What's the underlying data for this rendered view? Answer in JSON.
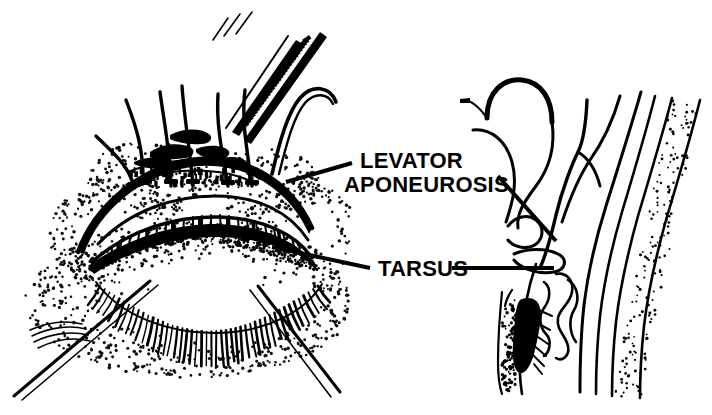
{
  "figure": {
    "background_color": "#ffffff",
    "ink_color": "#000000",
    "style": "pen-and-ink stipple line drawing",
    "width": 712,
    "height": 415
  },
  "labels": [
    {
      "id": "levator-aponeurosis",
      "line1": "LEVATOR",
      "line2": "APONEUROSIS",
      "x": 360,
      "y": 168,
      "font_size": 22
    },
    {
      "id": "tarsus",
      "line1": "TARSUS",
      "x": 378,
      "y": 274,
      "font_size": 22
    }
  ],
  "leader_lines": [
    {
      "id": "levator-leader-left",
      "from": [
        352,
        163
      ],
      "to": [
        286,
        182
      ],
      "width": 4
    },
    {
      "id": "levator-leader-right",
      "from": [
        498,
        175
      ],
      "to": [
        556,
        240
      ],
      "width": 4
    },
    {
      "id": "tarsus-leader-left",
      "from": [
        370,
        268
      ],
      "to": [
        272,
        247
      ],
      "width": 4
    },
    {
      "id": "tarsus-leader-right",
      "from": [
        452,
        268
      ],
      "to": [
        552,
        268
      ],
      "width": 4
    }
  ],
  "panels": [
    {
      "id": "frontal-view",
      "name": "frontal eyelid exposure",
      "region": [
        10,
        15,
        345,
        400
      ],
      "structures": [
        "forceps with serrated handles",
        "suture strands",
        "levator aponeurosis edge",
        "tarsal plate with meibomian gland striations",
        "conjunctival margin",
        "eyelashes",
        "retractor shafts",
        "stippled periorbital skin shading"
      ]
    },
    {
      "id": "sagittal-view",
      "name": "eyelid cross section",
      "region": [
        440,
        60,
        710,
        405
      ],
      "structures": [
        "curved suture needle",
        "suture thread loop",
        "levator aponeurosis branching",
        "Muller muscle",
        "conjunctiva",
        "tarsal plate",
        "meibomian glands",
        "eyelash roots",
        "stippled skin layer"
      ]
    }
  ]
}
